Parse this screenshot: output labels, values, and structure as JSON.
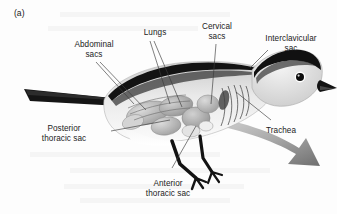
{
  "figure": {
    "panel_label": "(a)",
    "background_color": "#fdfdfd",
    "ink_color": "#1b1b1b",
    "arrow_color": "#8d8d8d"
  },
  "labels": {
    "abdominal_sacs": "Abdominal\nsacs",
    "lungs": "Lungs",
    "cervical_sacs": "Cervical\nsacs",
    "interclavicular_sac": "Interclavicular\nsac",
    "posterior_thoracic_sac": "Posterior\nthoracic sac",
    "anterior_thoracic_sac": "Anterior\nthoracic sac",
    "trachea": "Trachea"
  }
}
